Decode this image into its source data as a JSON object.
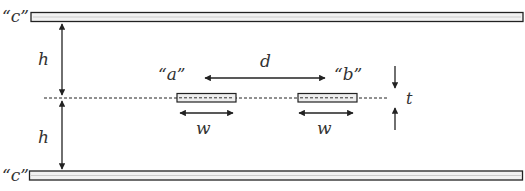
{
  "diagram": {
    "labels": {
      "plate_top": "“c”",
      "plate_bottom": "“c”",
      "strip_a": "“a”",
      "strip_b": "“b”",
      "separation": "d",
      "height_top": "h",
      "height_bottom": "h",
      "width_a": "w",
      "width_b": "w",
      "thickness": "t"
    },
    "colors": {
      "stroke": "#222222",
      "fill_plate": "#f2f2f2",
      "text": "#333333"
    }
  }
}
